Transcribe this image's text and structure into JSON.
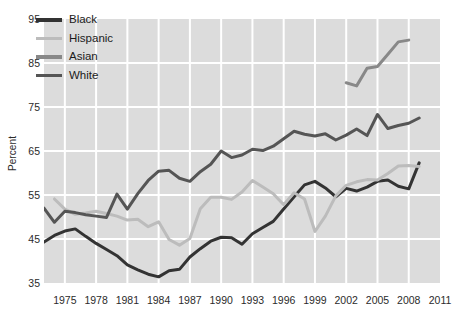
{
  "chart_data": {
    "type": "line",
    "title": "",
    "xlabel": "",
    "ylabel": "Percent",
    "xlim": [
      1973,
      2011
    ],
    "ylim": [
      35,
      95
    ],
    "yticks": [
      95,
      85,
      75,
      65,
      55,
      45,
      35
    ],
    "xticks": [
      1975,
      1978,
      1981,
      1984,
      1987,
      1990,
      1993,
      1996,
      1999,
      2002,
      2005,
      2008,
      2011
    ],
    "grid": true,
    "legend_position": "top-left",
    "series": [
      {
        "name": "Black",
        "color": "#333333",
        "x": [
          1973,
          1974,
          1975,
          1976,
          1977,
          1978,
          1979,
          1980,
          1981,
          1982,
          1983,
          1984,
          1985,
          1986,
          1987,
          1988,
          1989,
          1990,
          1991,
          1992,
          1993,
          1994,
          1995,
          1996,
          1997,
          1998,
          1999,
          2000,
          2001,
          2002,
          2003,
          2004,
          2005,
          2006,
          2007,
          2008,
          2009
        ],
        "y": [
          44.3,
          45.8,
          46.8,
          47.3,
          45.6,
          44.0,
          42.6,
          41.2,
          39.1,
          38.0,
          37.0,
          36.4,
          37.8,
          38.1,
          40.9,
          42.8,
          44.5,
          45.4,
          45.3,
          43.8,
          46.2,
          47.6,
          49.0,
          51.8,
          54.6,
          57.3,
          58.1,
          56.6,
          54.6,
          56.5,
          55.9,
          56.8,
          58.1,
          58.4,
          57.0,
          56.4,
          62.3
        ]
      },
      {
        "name": "Hispanic",
        "color": "#bcbcbc",
        "x": [
          1974,
          1975,
          1976,
          1977,
          1978,
          1979,
          1980,
          1981,
          1982,
          1983,
          1984,
          1985,
          1986,
          1987,
          1988,
          1989,
          1990,
          1991,
          1992,
          1993,
          1994,
          1995,
          1996,
          1997,
          1998,
          1999,
          2000,
          2001,
          2002,
          2003,
          2004,
          2005,
          2006,
          2007,
          2008,
          2009
        ],
        "y": [
          54.1,
          51.8,
          50.6,
          50.9,
          51.3,
          50.8,
          50.2,
          49.3,
          49.5,
          47.8,
          48.9,
          44.9,
          43.6,
          45.1,
          51.9,
          54.5,
          54.5,
          54.0,
          55.7,
          58.3,
          56.8,
          55.3,
          52.8,
          55.5,
          54.1,
          46.7,
          50.2,
          54.8,
          57.2,
          58.0,
          58.5,
          58.4,
          59.9,
          61.6,
          61.7,
          61.5
        ]
      },
      {
        "name": "Asian",
        "color": "#888888",
        "x": [
          2002,
          2003,
          2004,
          2005,
          2006,
          2007,
          2008
        ],
        "y": [
          80.5,
          79.8,
          83.8,
          84.2,
          87.0,
          89.8,
          90.2
        ]
      },
      {
        "name": "White",
        "color": "#555555",
        "x": [
          1973,
          1974,
          1975,
          1976,
          1977,
          1978,
          1979,
          1980,
          1981,
          1982,
          1983,
          1984,
          1985,
          1986,
          1987,
          1988,
          1989,
          1990,
          1991,
          1992,
          1993,
          1994,
          1995,
          1996,
          1997,
          1998,
          1999,
          2000,
          2001,
          2002,
          2003,
          2004,
          2005,
          2006,
          2007,
          2008,
          2009
        ],
        "y": [
          52.0,
          48.8,
          51.3,
          51.0,
          50.5,
          50.2,
          49.9,
          55.2,
          51.8,
          55.3,
          58.3,
          60.4,
          60.6,
          58.8,
          58.1,
          60.3,
          62.0,
          65.0,
          63.5,
          64.1,
          65.4,
          65.1,
          66.1,
          67.8,
          69.5,
          68.8,
          68.4,
          68.9,
          67.5,
          68.6,
          70.0,
          68.5,
          73.3,
          70.1,
          70.8,
          71.3,
          72.5
        ]
      }
    ]
  },
  "legend": {
    "items": [
      {
        "label": "Black",
        "color": "#333333"
      },
      {
        "label": "Hispanic",
        "color": "#bcbcbc"
      },
      {
        "label": "Asian",
        "color": "#888888"
      },
      {
        "label": "White",
        "color": "#555555"
      }
    ]
  },
  "axis": {
    "y_title": "Percent",
    "y_tick_labels": [
      "95",
      "85",
      "75",
      "65",
      "55",
      "45",
      "35"
    ],
    "x_tick_labels": [
      "1975",
      "1978",
      "1981",
      "1984",
      "1987",
      "1990",
      "1993",
      "1996",
      "1999",
      "2002",
      "2005",
      "2008",
      "2011"
    ]
  }
}
